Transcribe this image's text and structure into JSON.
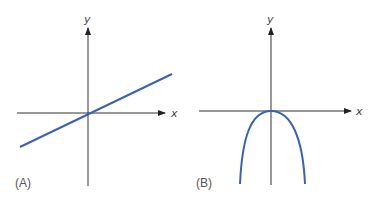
{
  "panels": [
    {
      "label": "(A)",
      "x_axis_label": "x",
      "y_axis_label": "y",
      "curve": "line through origin with positive slope"
    },
    {
      "label": "(B)",
      "x_axis_label": "x",
      "y_axis_label": "y",
      "curve": "downward-opening parabola with vertex at origin"
    }
  ],
  "colors": {
    "curve": "#3a62b0",
    "axis": "#333333"
  }
}
